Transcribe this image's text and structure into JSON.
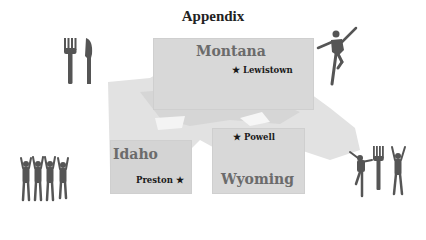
{
  "title": "Appendix",
  "states": [
    {
      "name": "Montana",
      "cities": [
        {
          "name": "Lewistown",
          "star": "★"
        }
      ]
    },
    {
      "name": "Idaho",
      "cities": [
        {
          "name": "Preston",
          "star": "★"
        }
      ]
    },
    {
      "name": "Wyoming",
      "cities": [
        {
          "name": "Powell",
          "star": "★"
        }
      ]
    }
  ],
  "icons": [
    "fork-knife-icon",
    "dancer-icon",
    "cheering-people-icon",
    "dancer-fork-person-icon"
  ],
  "colors": {
    "box": "#d8d8d8",
    "state_label": "#6b6b6b",
    "icon": "#555555"
  }
}
